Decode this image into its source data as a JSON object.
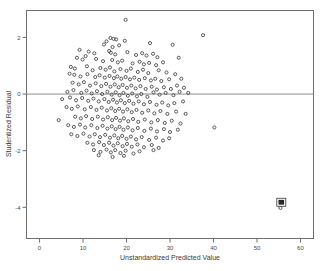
{
  "chart_data": {
    "type": "scatter",
    "title": "",
    "xlabel": "Unstandardized Predicted Value",
    "ylabel": "Studentized Residual",
    "xlim": [
      -3,
      63
    ],
    "ylim": [
      -5.1,
      2.95
    ],
    "xticks": [
      0,
      10,
      20,
      30,
      40,
      50,
      60
    ],
    "xticklabels": [
      "0",
      "10",
      "20",
      "30",
      "40",
      "50",
      "60"
    ],
    "yticks": [
      2,
      0,
      -2,
      -4
    ],
    "yticklabels": [
      "2",
      "0",
      "-2",
      "-4"
    ],
    "grid": false,
    "legend": null,
    "reference_line": {
      "orientation": "horizontal",
      "y": 0
    },
    "marker": {
      "shape": "circle-open",
      "size": 3.1,
      "edge_color": "#4a4a4a",
      "face_color": "none"
    },
    "frame_color": "#6e6e6e",
    "background_color": "#ffffff",
    "annotations": [
      {
        "text": "58",
        "x": 55.6,
        "y": -3.82,
        "boxed": true
      }
    ],
    "points": [
      [
        19.8,
        2.62
      ],
      [
        37.6,
        2.08
      ],
      [
        16.3,
        1.98
      ],
      [
        17.0,
        1.95
      ],
      [
        17.6,
        1.93
      ],
      [
        15.4,
        1.86
      ],
      [
        19.6,
        1.88
      ],
      [
        14.8,
        1.75
      ],
      [
        18.3,
        1.72
      ],
      [
        16.8,
        1.66
      ],
      [
        25.4,
        1.8
      ],
      [
        30.6,
        1.74
      ],
      [
        9.2,
        1.56
      ],
      [
        11.3,
        1.5
      ],
      [
        12.6,
        1.44
      ],
      [
        16.0,
        1.52
      ],
      [
        16.4,
        1.46
      ],
      [
        17.4,
        1.4
      ],
      [
        20.2,
        1.48
      ],
      [
        22.2,
        1.38
      ],
      [
        23.6,
        1.44
      ],
      [
        24.6,
        1.36
      ],
      [
        26.1,
        1.42
      ],
      [
        27.1,
        1.3
      ],
      [
        32.0,
        1.28
      ],
      [
        8.6,
        1.28
      ],
      [
        9.9,
        1.22
      ],
      [
        10.6,
        1.34
      ],
      [
        13.0,
        1.24
      ],
      [
        14.6,
        1.16
      ],
      [
        16.7,
        1.2
      ],
      [
        18.0,
        1.12
      ],
      [
        19.0,
        1.18
      ],
      [
        21.4,
        1.08
      ],
      [
        23.0,
        1.14
      ],
      [
        24.0,
        1.05
      ],
      [
        25.2,
        1.1
      ],
      [
        26.8,
        1.02
      ],
      [
        28.4,
        1.12
      ],
      [
        7.2,
        0.96
      ],
      [
        8.1,
        0.9
      ],
      [
        10.9,
        0.98
      ],
      [
        12.2,
        0.84
      ],
      [
        14.0,
        0.92
      ],
      [
        15.2,
        0.86
      ],
      [
        16.2,
        0.94
      ],
      [
        17.2,
        0.8
      ],
      [
        18.6,
        0.88
      ],
      [
        20.0,
        0.82
      ],
      [
        21.0,
        0.9
      ],
      [
        22.6,
        0.78
      ],
      [
        23.8,
        0.86
      ],
      [
        25.0,
        0.74
      ],
      [
        27.4,
        0.84
      ],
      [
        29.2,
        0.76
      ],
      [
        31.2,
        0.7
      ],
      [
        6.9,
        0.72
      ],
      [
        8.0,
        0.68
      ],
      [
        9.4,
        0.62
      ],
      [
        11.0,
        0.7
      ],
      [
        12.8,
        0.6
      ],
      [
        13.8,
        0.66
      ],
      [
        15.0,
        0.58
      ],
      [
        16.1,
        0.64
      ],
      [
        17.1,
        0.56
      ],
      [
        17.9,
        0.62
      ],
      [
        18.8,
        0.54
      ],
      [
        19.8,
        0.6
      ],
      [
        20.8,
        0.52
      ],
      [
        21.8,
        0.58
      ],
      [
        22.9,
        0.5
      ],
      [
        24.2,
        0.56
      ],
      [
        25.6,
        0.48
      ],
      [
        26.6,
        0.54
      ],
      [
        28.0,
        0.46
      ],
      [
        29.8,
        0.52
      ],
      [
        32.6,
        0.54
      ],
      [
        7.6,
        0.4
      ],
      [
        9.0,
        0.34
      ],
      [
        10.2,
        0.42
      ],
      [
        11.6,
        0.3
      ],
      [
        12.9,
        0.38
      ],
      [
        14.2,
        0.28
      ],
      [
        15.3,
        0.36
      ],
      [
        16.3,
        0.26
      ],
      [
        17.3,
        0.34
      ],
      [
        18.2,
        0.24
      ],
      [
        19.1,
        0.32
      ],
      [
        20.1,
        0.22
      ],
      [
        21.1,
        0.3
      ],
      [
        22.1,
        0.2
      ],
      [
        23.2,
        0.28
      ],
      [
        24.4,
        0.18
      ],
      [
        25.8,
        0.26
      ],
      [
        27.0,
        0.16
      ],
      [
        28.6,
        0.24
      ],
      [
        30.2,
        0.18
      ],
      [
        31.6,
        0.3
      ],
      [
        33.2,
        0.22
      ],
      [
        6.4,
        0.08
      ],
      [
        7.8,
        0.14
      ],
      [
        9.6,
        0.04
      ],
      [
        10.8,
        0.12
      ],
      [
        12.0,
        0.02
      ],
      [
        13.2,
        0.1
      ],
      [
        14.4,
        0.0
      ],
      [
        15.6,
        0.08
      ],
      [
        16.6,
        -0.02
      ],
      [
        17.5,
        0.06
      ],
      [
        18.4,
        -0.04
      ],
      [
        19.3,
        0.04
      ],
      [
        20.3,
        -0.06
      ],
      [
        21.3,
        0.02
      ],
      [
        22.4,
        -0.08
      ],
      [
        23.4,
        0.0
      ],
      [
        24.8,
        -0.1
      ],
      [
        26.2,
        0.06
      ],
      [
        27.6,
        -0.02
      ],
      [
        29.0,
        0.04
      ],
      [
        30.8,
        -0.04
      ],
      [
        32.2,
        0.08
      ],
      [
        34.2,
        0.04
      ],
      [
        5.2,
        -0.18
      ],
      [
        7.0,
        -0.12
      ],
      [
        8.4,
        -0.22
      ],
      [
        9.8,
        -0.14
      ],
      [
        11.2,
        -0.24
      ],
      [
        12.4,
        -0.16
      ],
      [
        13.6,
        -0.26
      ],
      [
        14.9,
        -0.18
      ],
      [
        15.9,
        -0.28
      ],
      [
        16.9,
        -0.2
      ],
      [
        17.8,
        -0.3
      ],
      [
        18.7,
        -0.22
      ],
      [
        19.6,
        -0.32
      ],
      [
        20.6,
        -0.24
      ],
      [
        21.6,
        -0.34
      ],
      [
        22.8,
        -0.26
      ],
      [
        24.0,
        -0.36
      ],
      [
        25.4,
        -0.28
      ],
      [
        26.9,
        -0.38
      ],
      [
        28.2,
        -0.3
      ],
      [
        29.6,
        -0.4
      ],
      [
        31.0,
        -0.32
      ],
      [
        33.0,
        -0.26
      ],
      [
        6.2,
        -0.46
      ],
      [
        7.4,
        -0.52
      ],
      [
        8.8,
        -0.44
      ],
      [
        10.4,
        -0.54
      ],
      [
        11.8,
        -0.46
      ],
      [
        13.1,
        -0.56
      ],
      [
        14.3,
        -0.48
      ],
      [
        15.5,
        -0.58
      ],
      [
        16.5,
        -0.5
      ],
      [
        17.4,
        -0.6
      ],
      [
        18.3,
        -0.52
      ],
      [
        19.2,
        -0.62
      ],
      [
        20.2,
        -0.54
      ],
      [
        21.2,
        -0.64
      ],
      [
        22.3,
        -0.56
      ],
      [
        23.6,
        -0.66
      ],
      [
        25.0,
        -0.58
      ],
      [
        26.4,
        -0.68
      ],
      [
        27.8,
        -0.6
      ],
      [
        29.4,
        -0.7
      ],
      [
        31.4,
        -0.62
      ],
      [
        33.6,
        -0.7
      ],
      [
        8.2,
        -0.8
      ],
      [
        9.5,
        -0.86
      ],
      [
        10.7,
        -0.78
      ],
      [
        12.1,
        -0.88
      ],
      [
        13.4,
        -0.8
      ],
      [
        14.6,
        -0.9
      ],
      [
        15.7,
        -0.82
      ],
      [
        16.7,
        -0.92
      ],
      [
        17.6,
        -0.84
      ],
      [
        18.5,
        -0.94
      ],
      [
        19.4,
        -0.86
      ],
      [
        20.4,
        -0.96
      ],
      [
        21.5,
        -0.88
      ],
      [
        22.7,
        -0.98
      ],
      [
        24.2,
        -0.9
      ],
      [
        25.7,
        -1.0
      ],
      [
        27.2,
        -0.92
      ],
      [
        28.8,
        -1.02
      ],
      [
        30.4,
        -0.94
      ],
      [
        32.4,
        -1.04
      ],
      [
        4.4,
        -0.92
      ],
      [
        6.6,
        -1.1
      ],
      [
        7.9,
        -1.16
      ],
      [
        9.3,
        -1.08
      ],
      [
        10.5,
        -1.18
      ],
      [
        11.9,
        -1.1
      ],
      [
        13.3,
        -1.2
      ],
      [
        14.5,
        -1.12
      ],
      [
        15.6,
        -1.22
      ],
      [
        16.6,
        -1.14
      ],
      [
        17.5,
        -1.24
      ],
      [
        18.4,
        -1.16
      ],
      [
        19.3,
        -1.26
      ],
      [
        20.3,
        -1.18
      ],
      [
        21.4,
        -1.28
      ],
      [
        22.6,
        -1.2
      ],
      [
        24.1,
        -1.3
      ],
      [
        25.6,
        -1.22
      ],
      [
        27.0,
        -1.32
      ],
      [
        28.6,
        -1.24
      ],
      [
        30.0,
        -1.34
      ],
      [
        31.8,
        -1.26
      ],
      [
        40.2,
        -1.18
      ],
      [
        7.3,
        -1.42
      ],
      [
        8.7,
        -1.48
      ],
      [
        10.1,
        -1.4
      ],
      [
        11.5,
        -1.5
      ],
      [
        12.7,
        -1.42
      ],
      [
        13.9,
        -1.52
      ],
      [
        15.1,
        -1.44
      ],
      [
        16.2,
        -1.54
      ],
      [
        17.2,
        -1.46
      ],
      [
        18.1,
        -1.56
      ],
      [
        19.0,
        -1.48
      ],
      [
        20.0,
        -1.58
      ],
      [
        21.0,
        -1.5
      ],
      [
        22.2,
        -1.6
      ],
      [
        23.5,
        -1.52
      ],
      [
        25.2,
        -1.62
      ],
      [
        26.8,
        -1.54
      ],
      [
        28.4,
        -1.64
      ],
      [
        29.8,
        -1.56
      ],
      [
        11.0,
        -1.72
      ],
      [
        12.3,
        -1.78
      ],
      [
        13.7,
        -1.7
      ],
      [
        14.8,
        -1.8
      ],
      [
        16.0,
        -1.72
      ],
      [
        17.0,
        -1.82
      ],
      [
        18.0,
        -1.74
      ],
      [
        19.1,
        -1.84
      ],
      [
        20.1,
        -1.76
      ],
      [
        21.2,
        -1.86
      ],
      [
        22.5,
        -1.78
      ],
      [
        24.0,
        -1.88
      ],
      [
        25.8,
        -1.8
      ],
      [
        27.4,
        -1.9
      ],
      [
        12.5,
        -1.98
      ],
      [
        14.0,
        -2.04
      ],
      [
        15.4,
        -1.96
      ],
      [
        16.4,
        -2.06
      ],
      [
        17.4,
        -1.98
      ],
      [
        18.6,
        -2.08
      ],
      [
        19.8,
        -2.0
      ],
      [
        21.6,
        -2.1
      ],
      [
        23.0,
        -2.02
      ],
      [
        26.2,
        -1.98
      ],
      [
        16.8,
        -2.22
      ],
      [
        19.4,
        -2.18
      ],
      [
        13.6,
        -2.16
      ],
      [
        55.4,
        -4.02
      ]
    ]
  }
}
